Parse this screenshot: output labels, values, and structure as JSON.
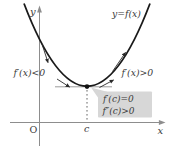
{
  "figure": {
    "curve_label": "y=f(x)",
    "shape_description": "upward-opening parabola with minimum at x = c",
    "labels": {
      "y_axis": "y",
      "x_axis": "x",
      "origin": "O",
      "critical_x": "c",
      "left_region": "f′(x)<0",
      "right_region": "f′(x)>0"
    },
    "callout": {
      "line1": "f′(c)=0",
      "line2": "f″(c)>0"
    },
    "colors": {
      "curve": "#1a1a1a",
      "axis": "#8d8d8d",
      "tangent_line": "#9c9c9c",
      "dotted_guide": "#555555",
      "callout_bg": "#d7d7d7",
      "text": "#3a3a3a",
      "background": "#ffffff"
    }
  }
}
